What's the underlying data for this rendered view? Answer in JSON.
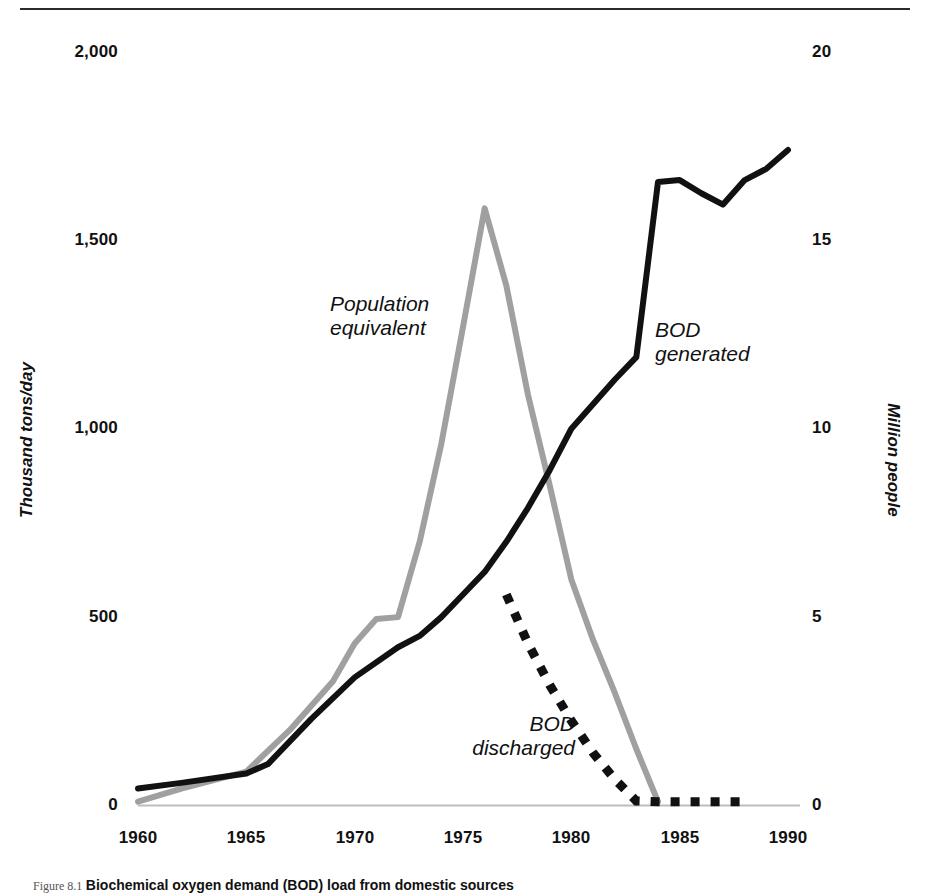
{
  "figure": {
    "caption_lead": "Figure 8.1",
    "caption_title": "Biochemical oxygen demand (BOD) load from domestic sources"
  },
  "chart_data": {
    "type": "line",
    "title": "",
    "subtitle": "",
    "xlabel": "",
    "ylabel": "Thousand tons/day",
    "ylabel_right": "Million people",
    "grid": false,
    "legend_position": "inline-annotations",
    "xlim": [
      1960,
      1990
    ],
    "ylim": [
      0,
      2000
    ],
    "ylim_right": [
      0,
      20
    ],
    "xticks": [
      "1960",
      "1965",
      "1970",
      "1975",
      "1980",
      "1985",
      "1990"
    ],
    "xtick_values": [
      1960,
      1965,
      1970,
      1975,
      1980,
      1985,
      1990
    ],
    "yticks_left": [
      "2,000",
      "1,500",
      "1,000",
      "500",
      "0"
    ],
    "ytick_values_left": [
      2000,
      1500,
      1000,
      500,
      0
    ],
    "yticks_right": [
      "20",
      "15",
      "10",
      "5",
      "0"
    ],
    "ytick_values_right": [
      20,
      15,
      10,
      5,
      0
    ],
    "series": [
      {
        "name": "BOD generated",
        "label": "BOD\ngenerated",
        "axis": "left",
        "color": "#111111",
        "style": "solid",
        "x": [
          1960,
          1962,
          1965,
          1966,
          1968,
          1970,
          1972,
          1973,
          1974,
          1975,
          1976,
          1977,
          1978,
          1979,
          1980,
          1981,
          1982,
          1983,
          1984,
          1985,
          1986,
          1987,
          1988,
          1989,
          1990
        ],
        "values": [
          45,
          60,
          85,
          110,
          230,
          340,
          420,
          450,
          500,
          560,
          620,
          700,
          790,
          890,
          1000,
          1065,
          1130,
          1190,
          1655,
          1660,
          1625,
          1595,
          1660,
          1690,
          1740
        ]
      },
      {
        "name": "Population equivalent",
        "label": "Population\nequivalent",
        "axis": "right",
        "color": "#a0a0a0",
        "style": "solid",
        "x": [
          1960,
          1962,
          1965,
          1967,
          1969,
          1970,
          1971,
          1972,
          1973,
          1974,
          1975,
          1976,
          1977,
          1978,
          1979,
          1980,
          1981,
          1982,
          1983,
          1984
        ],
        "values_left_scale": [
          10,
          45,
          90,
          200,
          330,
          430,
          495,
          500,
          700,
          960,
          1270,
          1585,
          1380,
          1090,
          850,
          600,
          440,
          300,
          150,
          10
        ],
        "values": [
          0.1,
          0.45,
          0.9,
          2.0,
          3.3,
          4.3,
          4.95,
          5.0,
          7.0,
          9.6,
          12.7,
          15.85,
          13.8,
          10.9,
          8.5,
          6.0,
          4.4,
          3.0,
          1.5,
          0.1
        ]
      },
      {
        "name": "BOD discharged",
        "label": "BOD\ndischarged",
        "axis": "left",
        "color": "#111111",
        "style": "dotted",
        "x": [
          1977,
          1978,
          1979,
          1980,
          1981,
          1982,
          1983,
          1984,
          1985,
          1986,
          1987,
          1988
        ],
        "values": [
          560,
          430,
          320,
          225,
          140,
          70,
          12,
          10,
          10,
          10,
          10,
          10
        ]
      }
    ]
  }
}
